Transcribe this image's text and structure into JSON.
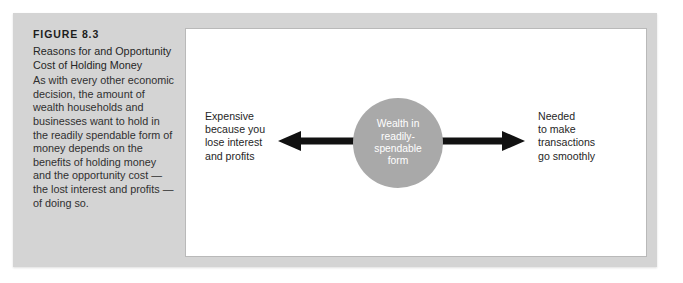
{
  "figure": {
    "number": "FIGURE 8.3",
    "title": "Reasons for and Opportunity Cost of Holding Money",
    "body": "As with every other economic decision, the amount of wealth households and businesses want to hold in the readily spendable form of money depends on the benefits of holding money and the opportunity cost — the lost interest and profits — of doing so."
  },
  "diagram": {
    "center_node": {
      "label": "Wealth in\nreadily-\nspendable\nform",
      "shape": "circle",
      "fill_color": "#a9a9a9",
      "text_color": "#ffffff"
    },
    "left_branch": {
      "label": "Expensive\nbecause you\nlose interest\nand profits",
      "arrow_direction": "left",
      "arrow_color": "#111111"
    },
    "right_branch": {
      "label": "Needed\nto make\ntransactions\ngo smoothly",
      "arrow_direction": "right",
      "arrow_color": "#111111"
    }
  },
  "colors": {
    "panel_background": "#d4d4d4",
    "diagram_background": "#ffffff",
    "diagram_border": "#b9b9b9",
    "text": "#262626"
  }
}
